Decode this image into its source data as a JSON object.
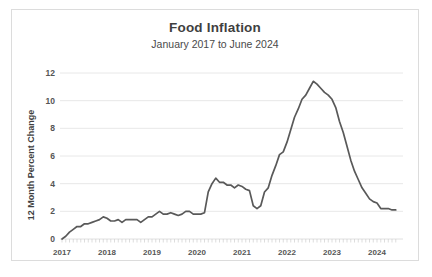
{
  "chart_data": {
    "type": "line",
    "title": "Food Inflation",
    "subtitle": "January 2017 to June 2024",
    "xlabel": "",
    "ylabel": "12 Month Percent Change",
    "ylim": [
      0,
      12
    ],
    "yticks": [
      0,
      2,
      4,
      6,
      8,
      10,
      12
    ],
    "ytick_labels": [
      "0",
      "2",
      "4",
      "6",
      "8",
      "10",
      "12"
    ],
    "xlim": [
      "2017-01",
      "2024-06"
    ],
    "xticks": [
      "2017",
      "2018",
      "2019",
      "2020",
      "2021",
      "2022",
      "2023",
      "2024"
    ],
    "xtick_labels": [
      "2017",
      "2018",
      "2019",
      "2020",
      "2021",
      "2022",
      "2023",
      "2024"
    ],
    "grid": "horizontal",
    "legend": "none",
    "line_color": "#595959",
    "minor_ticks": "monthly",
    "series": [
      {
        "name": "Food Inflation",
        "x": [
          "2017-01",
          "2017-02",
          "2017-03",
          "2017-04",
          "2017-05",
          "2017-06",
          "2017-07",
          "2017-08",
          "2017-09",
          "2017-10",
          "2017-11",
          "2017-12",
          "2018-01",
          "2018-02",
          "2018-03",
          "2018-04",
          "2018-05",
          "2018-06",
          "2018-07",
          "2018-08",
          "2018-09",
          "2018-10",
          "2018-11",
          "2018-12",
          "2019-01",
          "2019-02",
          "2019-03",
          "2019-04",
          "2019-05",
          "2019-06",
          "2019-07",
          "2019-08",
          "2019-09",
          "2019-10",
          "2019-11",
          "2019-12",
          "2020-01",
          "2020-02",
          "2020-03",
          "2020-04",
          "2020-05",
          "2020-06",
          "2020-07",
          "2020-08",
          "2020-09",
          "2020-10",
          "2020-11",
          "2020-12",
          "2021-01",
          "2021-02",
          "2021-03",
          "2021-04",
          "2021-05",
          "2021-06",
          "2021-07",
          "2021-08",
          "2021-09",
          "2021-10",
          "2021-11",
          "2021-12",
          "2022-01",
          "2022-02",
          "2022-03",
          "2022-04",
          "2022-05",
          "2022-06",
          "2022-07",
          "2022-08",
          "2022-09",
          "2022-10",
          "2022-11",
          "2022-12",
          "2023-01",
          "2023-02",
          "2023-03",
          "2023-04",
          "2023-05",
          "2023-06",
          "2023-07",
          "2023-08",
          "2023-09",
          "2023-10",
          "2023-11",
          "2023-12",
          "2024-01",
          "2024-02",
          "2024-03",
          "2024-04",
          "2024-05",
          "2024-06"
        ],
        "values": [
          0.0,
          0.2,
          0.5,
          0.7,
          0.9,
          0.9,
          1.1,
          1.1,
          1.2,
          1.3,
          1.4,
          1.6,
          1.5,
          1.3,
          1.3,
          1.4,
          1.2,
          1.4,
          1.4,
          1.4,
          1.4,
          1.2,
          1.4,
          1.6,
          1.6,
          1.8,
          2.0,
          1.8,
          1.8,
          1.9,
          1.8,
          1.7,
          1.8,
          2.0,
          2.0,
          1.8,
          1.8,
          1.8,
          1.9,
          3.4,
          4.0,
          4.4,
          4.1,
          4.1,
          3.9,
          3.9,
          3.7,
          3.9,
          3.8,
          3.6,
          3.5,
          2.4,
          2.2,
          2.4,
          3.4,
          3.7,
          4.6,
          5.3,
          6.1,
          6.3,
          7.0,
          7.9,
          8.8,
          9.4,
          10.1,
          10.4,
          10.9,
          11.4,
          11.2,
          10.9,
          10.6,
          10.4,
          10.1,
          9.5,
          8.5,
          7.7,
          6.7,
          5.7,
          4.9,
          4.3,
          3.7,
          3.3,
          2.9,
          2.7,
          2.6,
          2.2,
          2.2,
          2.2,
          2.1,
          2.1
        ]
      }
    ]
  }
}
